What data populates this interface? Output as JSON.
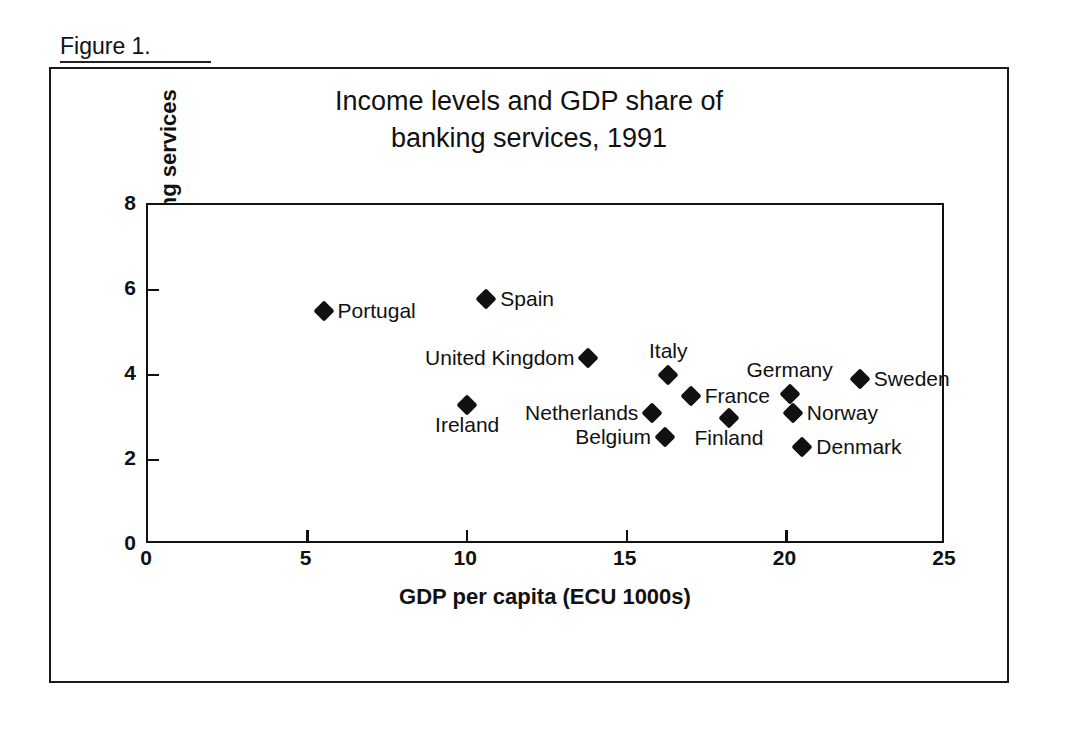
{
  "figure": {
    "caption": "Figure 1."
  },
  "chart_data": {
    "type": "scatter",
    "title": "Income levels and GDP share of banking services, 1991",
    "title_lines": [
      "Income levels and GDP share of",
      "banking services, 1991"
    ],
    "xlabel": "GDP per capita (ECU 1000s)",
    "ylabel": "GDP share of banking services",
    "xlim": [
      0,
      25
    ],
    "ylim": [
      0,
      8
    ],
    "xticks": [
      0,
      5,
      10,
      15,
      20,
      25
    ],
    "yticks": [
      0,
      2,
      4,
      6,
      8
    ],
    "xtick_labels": [
      "0",
      "5",
      "10",
      "15",
      "20",
      "25"
    ],
    "ytick_labels": [
      "0",
      "2",
      "4",
      "6",
      "8"
    ],
    "grid": false,
    "legend": "none",
    "marker": "diamond",
    "marker_color": "#111111",
    "points": [
      {
        "name": "Portugal",
        "x": 5.5,
        "y": 5.5,
        "label_pos": "right"
      },
      {
        "name": "Spain",
        "x": 10.6,
        "y": 5.8,
        "label_pos": "right"
      },
      {
        "name": "Ireland",
        "x": 10.0,
        "y": 3.3,
        "label_pos": "below"
      },
      {
        "name": "United Kingdom",
        "x": 13.8,
        "y": 4.4,
        "label_pos": "left"
      },
      {
        "name": "Italy",
        "x": 16.3,
        "y": 4.0,
        "label_pos": "above"
      },
      {
        "name": "France",
        "x": 17.0,
        "y": 3.5,
        "label_pos": "right"
      },
      {
        "name": "Netherlands",
        "x": 15.8,
        "y": 3.1,
        "label_pos": "left"
      },
      {
        "name": "Belgium",
        "x": 16.2,
        "y": 2.55,
        "label_pos": "left"
      },
      {
        "name": "Finland",
        "x": 18.2,
        "y": 3.0,
        "label_pos": "below"
      },
      {
        "name": "Germany",
        "x": 20.1,
        "y": 3.55,
        "label_pos": "above"
      },
      {
        "name": "Norway",
        "x": 20.2,
        "y": 3.1,
        "label_pos": "right"
      },
      {
        "name": "Denmark",
        "x": 20.5,
        "y": 2.3,
        "label_pos": "right"
      },
      {
        "name": "Sweden",
        "x": 22.3,
        "y": 3.9,
        "label_pos": "right"
      }
    ]
  }
}
